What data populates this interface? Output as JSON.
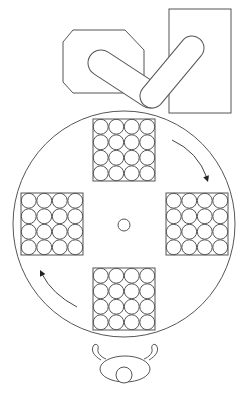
{
  "diagram": {
    "type": "workcell-layout",
    "colors": {
      "stroke": "#555555",
      "fill": "#ffffff",
      "arrow": "#222222"
    },
    "machine_octagon": {
      "points": [
        [
          73,
          30
        ],
        [
          125,
          30
        ],
        [
          144,
          50
        ],
        [
          144,
          82
        ],
        [
          133,
          93
        ],
        [
          73,
          93
        ],
        [
          63,
          82
        ],
        [
          63,
          42
        ]
      ]
    },
    "machine_rectangle": {
      "x": 169,
      "y": 9,
      "width": 62,
      "height": 104
    },
    "robot_links": [
      {
        "name": "link-1",
        "cx1": 101,
        "cy1": 63,
        "cx2": 150,
        "cy2": 95,
        "radius": 13
      },
      {
        "name": "link-2",
        "cx1": 152,
        "cy1": 96,
        "cx2": 192,
        "cy2": 48,
        "radius": 12
      }
    ],
    "turntable": {
      "cx": 124,
      "cy": 224,
      "rx": 111,
      "ry": 113
    },
    "center_hub": {
      "cx": 124,
      "cy": 225,
      "r": 6
    },
    "trays": [
      {
        "name": "tray-top",
        "x": 93,
        "y": 119,
        "size": 62,
        "rows": 4,
        "cols": 4
      },
      {
        "name": "tray-right",
        "x": 166,
        "y": 193,
        "size": 62,
        "rows": 4,
        "cols": 4
      },
      {
        "name": "tray-left",
        "x": 21,
        "y": 193,
        "size": 62,
        "rows": 4,
        "cols": 4
      },
      {
        "name": "tray-bottom",
        "x": 93,
        "y": 268,
        "size": 62,
        "rows": 4,
        "cols": 4
      }
    ],
    "rotation_arrows": [
      {
        "name": "arrow-clockwise-right",
        "path": "M172 140 Q198 152 207 178",
        "head": [
          208,
          182
        ]
      },
      {
        "name": "arrow-clockwise-left",
        "path": "M77 307 Q52 294 42 274",
        "head": [
          40,
          270
        ]
      }
    ],
    "operator": {
      "body": {
        "cx": 125,
        "cy": 369,
        "rx": 25,
        "ry": 13
      },
      "head": {
        "cx": 124,
        "cy": 375,
        "r": 8
      },
      "left_arm": "M101 360 C94 356 90 350 94 345 C97 343 99 346 98 349 C97 353 101 357 106 359",
      "right_arm": "M149 360 C156 356 160 350 156 345 C153 343 151 346 152 349 C153 353 149 357 144 359"
    }
  }
}
